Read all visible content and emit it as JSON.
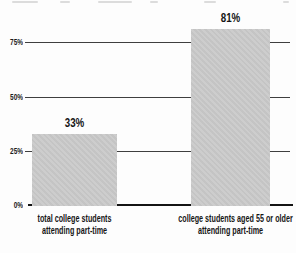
{
  "chart_data": {
    "type": "bar",
    "title": "",
    "xlabel": "",
    "ylabel": "",
    "categories": [
      {
        "line1": "total college students",
        "line2": "attending part-time"
      },
      {
        "line1": "college students aged 55 or older",
        "line2": "attending part-time"
      }
    ],
    "values": [
      33,
      81
    ],
    "value_labels": [
      "33%",
      "81%"
    ],
    "yticks": [
      "0%",
      "25%",
      "50%",
      "75%"
    ],
    "ylim": [
      0,
      95
    ],
    "grid": "horizontal",
    "legend": "none",
    "bar_color": "#c9c9c9",
    "gridline_color": "#3f3f3f",
    "axis_color": "#141414",
    "text_color": "#141414"
  }
}
